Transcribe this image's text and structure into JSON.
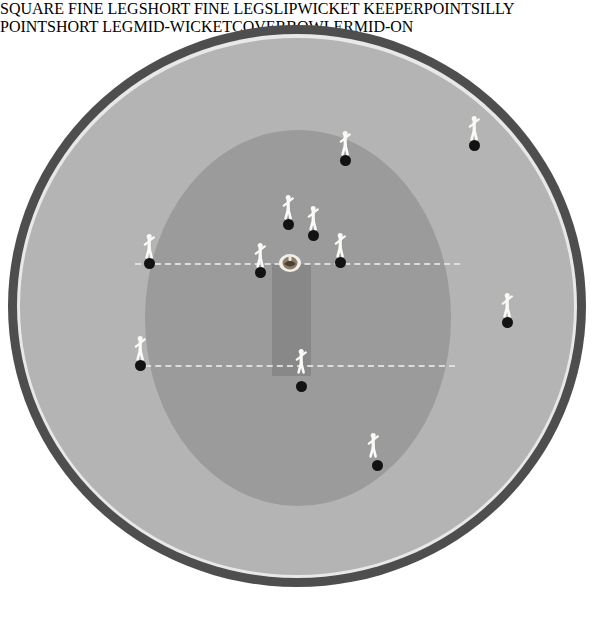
{
  "diagram": {
    "colors": {
      "page_background": "#ffffff",
      "boundary_ring": "#4e4e4e",
      "boundary_line": "#e8e8e8",
      "outfield": "#b4b4b4",
      "inner_circle": "#9b9b9b",
      "pitch": "#888888",
      "crease_line": "#e2e2e2",
      "fielder_dot": "#121212",
      "label_text": "#ffffff"
    }
  },
  "pitch": {
    "batsman_name": "batsman-at-crease",
    "crease_batting": "batting-crease-line",
    "crease_bowling": "bowling-crease-line"
  },
  "fielders": [
    {
      "label": "SQUARE FINE LEG",
      "dot_x": 474,
      "dot_y": 145,
      "fig_x": 474,
      "fig_y": 145,
      "label_x": 494,
      "label_y": 157,
      "align": "center"
    },
    {
      "label": "SHORT FINE LEG",
      "dot_x": 345,
      "dot_y": 160,
      "fig_x": 345,
      "fig_y": 160,
      "label_x": 345,
      "label_y": 168,
      "align": "center"
    },
    {
      "label": "SLIP",
      "dot_x": 288,
      "dot_y": 224,
      "fig_x": 288,
      "fig_y": 224,
      "label_x": 268,
      "label_y": 222,
      "align": "right"
    },
    {
      "label": "WICKET KEEPER",
      "dot_x": 313,
      "dot_y": 235,
      "fig_x": 313,
      "fig_y": 235,
      "label_x": 297,
      "label_y": 238,
      "align": "center"
    },
    {
      "label": "POINT",
      "dot_x": 149,
      "dot_y": 263,
      "fig_x": 149,
      "fig_y": 263,
      "label_x": 144,
      "label_y": 264,
      "align": "center"
    },
    {
      "label": "SILLY POINT",
      "dot_x": 260,
      "dot_y": 272,
      "fig_x": 260,
      "fig_y": 272,
      "label_x": 231,
      "label_y": 276,
      "align": "center"
    },
    {
      "label": "SHORT LEG",
      "dot_x": 340,
      "dot_y": 262,
      "fig_x": 340,
      "fig_y": 262,
      "label_x": 355,
      "label_y": 265,
      "align": "left"
    },
    {
      "label": "MID-WICKET",
      "dot_x": 507,
      "dot_y": 322,
      "fig_x": 507,
      "fig_y": 322,
      "label_x": 507,
      "label_y": 330,
      "align": "center"
    },
    {
      "label": "COVER",
      "dot_x": 140,
      "dot_y": 365,
      "fig_x": 140,
      "fig_y": 365,
      "label_x": 136,
      "label_y": 371,
      "align": "center"
    },
    {
      "label": "BOWLER",
      "dot_x": 301,
      "dot_y": 386,
      "fig_x": 301,
      "fig_y": 378,
      "label_x": 301,
      "label_y": 390,
      "align": "center"
    },
    {
      "label": "MID-ON",
      "dot_x": 377,
      "dot_y": 465,
      "fig_x": 373,
      "fig_y": 462,
      "label_x": 387,
      "label_y": 471,
      "align": "left"
    }
  ]
}
